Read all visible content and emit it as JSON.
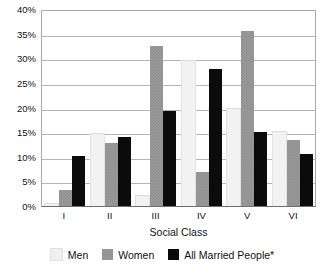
{
  "chart_data": {
    "type": "bar",
    "title": "",
    "xlabel": "Social Class",
    "ylabel": "",
    "categories": [
      "I",
      "II",
      "III",
      "IV",
      "V",
      "VI"
    ],
    "series": [
      {
        "name": "Men",
        "color": "#f0f0f0",
        "values": [
          0.5,
          14.6,
          2.0,
          29.5,
          19.8,
          15.1
        ]
      },
      {
        "name": "Women",
        "color": "#9a9a9a",
        "values": [
          3.2,
          12.8,
          32.4,
          7.0,
          35.5,
          13.5
        ]
      },
      {
        "name": "All Married People*",
        "color": "#0b0b0b",
        "values": [
          10.2,
          14.1,
          19.3,
          27.9,
          15.0,
          10.5
        ]
      }
    ],
    "ylim": [
      0,
      40
    ],
    "yticks": [
      "0%",
      "5%",
      "10%",
      "15%",
      "20%",
      "25%",
      "30%",
      "35%",
      "40%"
    ],
    "ytick_values": [
      0,
      5,
      10,
      15,
      20,
      25,
      30,
      35,
      40
    ],
    "grid": true,
    "legend_position": "bottom"
  },
  "legend": {
    "items": [
      {
        "label": "Men"
      },
      {
        "label": "Women"
      },
      {
        "label": "All Married People*"
      }
    ]
  }
}
